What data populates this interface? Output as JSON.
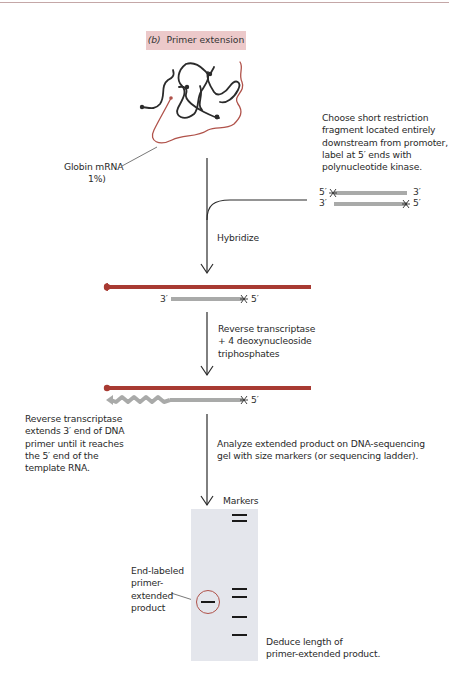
{
  "figure": {
    "panel_label": "(b)",
    "title": "Primer extension",
    "accent_color": "#a83a32",
    "primer_color": "#a9aaa9",
    "gel_color": "#e4e6ec",
    "title_box_color": "#ecc9ca"
  },
  "labels": {
    "globin_mrna": "Globin mRNA",
    "globin_pct": "1%)",
    "choose_fragment": [
      "Choose short restriction",
      "fragment located entirely",
      "downstream from promoter,",
      "label at 5′ ends with",
      "polynucleotide kinase."
    ],
    "hybridize": "Hybridize",
    "reverse_transcriptase_step": [
      "Reverse transcriptase",
      "+ 4 deoxynucleoside",
      "triphosphates"
    ],
    "extension_note": [
      "Reverse transcriptase",
      "extends 3′ end of DNA",
      "primer until it reaches",
      "the 5′ end of the",
      "template RNA."
    ],
    "analyze_step": [
      "Analyze extended product on DNA-sequencing",
      "gel with size markers (or sequencing ladder)."
    ],
    "markers": "Markers",
    "end_labeled": [
      "End-labeled",
      "primer-",
      "extended",
      "product"
    ],
    "deduce": [
      "Deduce length of",
      "primer-extended product."
    ]
  },
  "strand_ends": {
    "probe_top_left": "5′",
    "probe_top_right": "3′",
    "probe_bottom_left": "3′",
    "probe_bottom_right": "5′",
    "hybrid_left": "3′",
    "hybrid_right": "5′",
    "extended_right": "5′",
    "label_marker": "*"
  },
  "gel": {
    "lanes": [
      "sample",
      "markers"
    ],
    "marker_bands_y": [
      15,
      21,
      89,
      97,
      117,
      135
    ],
    "sample_band_y": 101
  }
}
